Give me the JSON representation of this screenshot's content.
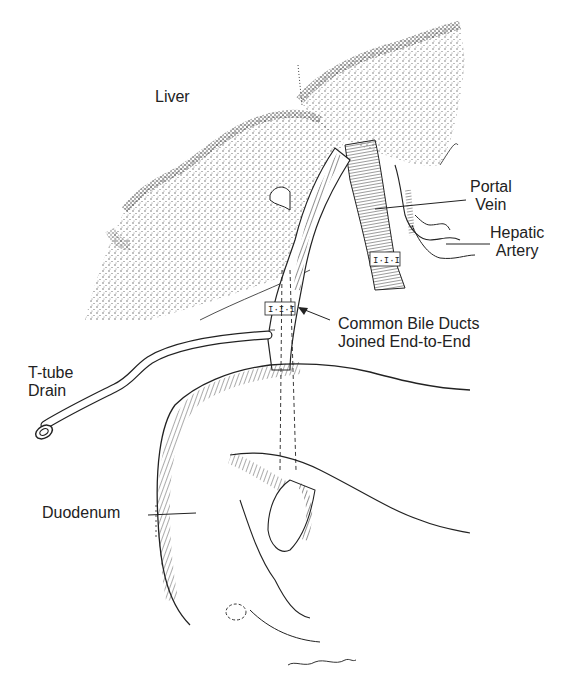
{
  "figure": {
    "cropped_top_text": "ng y a p",
    "labels": {
      "liver": "Liver",
      "portal_vein": [
        "Portal",
        "Vein"
      ],
      "hepatic_artery": [
        "Hepatic",
        "Artery"
      ],
      "common_bile_ducts": [
        "Common Bile Ducts",
        "Joined End-to-End"
      ],
      "t_tube_drain": [
        "T-tube",
        "Drain"
      ],
      "duodenum": "Duodenum"
    },
    "signature": "Boden",
    "colors": {
      "ink": "#1a1a1a",
      "background": "#ffffff",
      "stipple": "#2a2a2a"
    }
  }
}
